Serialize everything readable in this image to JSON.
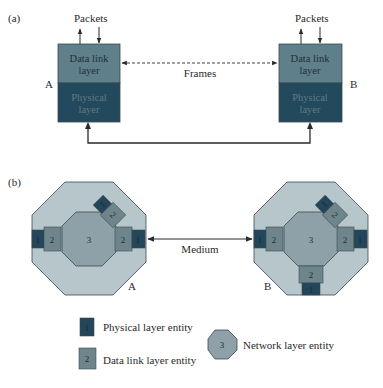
{
  "colors": {
    "datalink_box": "#5f7f8a",
    "physical_box": "#234a5c",
    "octagon_outer": "#b7c6cb",
    "octagon_inner": "#8ea1a8",
    "entity_physical": "#23465a",
    "entity_datalink": "#6f858c",
    "stroke": "#3a4a52",
    "text_dark": "#2a2a2a"
  },
  "part_a": {
    "label": "(a)",
    "node_a": {
      "name": "A",
      "packets_label": "Packets",
      "datalink_line1": "Data link",
      "datalink_line2": "layer",
      "physical_line1": "Physical",
      "physical_line2": "layer"
    },
    "node_b": {
      "name": "B",
      "packets_label": "Packets",
      "datalink_line1": "Data link",
      "datalink_line2": "layer",
      "physical_line1": "Physical",
      "physical_line2": "layer"
    },
    "frames_label": "Frames"
  },
  "part_b": {
    "label": "(b)",
    "node_a": {
      "name": "A",
      "network_entity": "3",
      "datalink_entities": [
        "2",
        "2",
        "2"
      ],
      "physical_entities": [
        "1",
        "1",
        "1"
      ]
    },
    "node_b": {
      "name": "B",
      "network_entity": "3",
      "datalink_entities": [
        "2",
        "2",
        "2",
        "2"
      ],
      "physical_entities": [
        "1",
        "1",
        "1",
        "1"
      ]
    },
    "medium_label": "Medium"
  },
  "legend": {
    "physical": {
      "symbol": "1",
      "label": "Physical layer entity"
    },
    "datalink": {
      "symbol": "2",
      "label": "Data link layer entity"
    },
    "network": {
      "symbol": "3",
      "label": "Network layer entity"
    }
  }
}
